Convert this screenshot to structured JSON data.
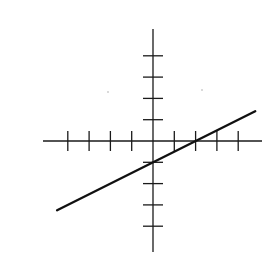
{
  "chart_data": {
    "type": "line",
    "title": "",
    "xlabel": "",
    "ylabel": "",
    "equation": "y = 0.5x - 1",
    "slope": 0.5,
    "y_intercept": -1,
    "x_intercept": 2,
    "xlim": [
      -5,
      5
    ],
    "ylim": [
      -5,
      5
    ],
    "x_ticks": [
      -4,
      -3,
      -2,
      -1,
      1,
      2,
      3,
      4
    ],
    "y_ticks": [
      -4,
      -3,
      -2,
      -1,
      1,
      2,
      3,
      4
    ],
    "tick_labels_shown": false,
    "grid": false,
    "legend": null,
    "series": [
      {
        "name": "line",
        "x": [
          -4.5,
          4.8
        ],
        "y": [
          -3.25,
          1.4
        ]
      }
    ]
  },
  "layout": {
    "origin_px": [
      153,
      141
    ],
    "unit_px": 21.3,
    "x_axis_px": [
      43,
      262
    ],
    "y_axis_px": [
      29,
      252
    ],
    "tick_half_len_px": 10,
    "colors": {
      "axis": "#1a1a1a",
      "line": "#111111",
      "background": "#ffffff"
    }
  }
}
